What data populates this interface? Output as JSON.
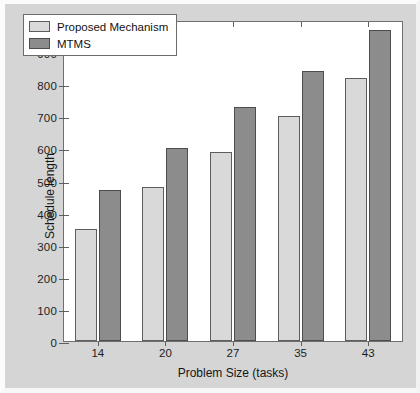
{
  "chart_data": {
    "type": "bar",
    "title": "",
    "xlabel": "Problem Size (tasks)",
    "ylabel": "Schedule length",
    "categories": [
      "14",
      "20",
      "27",
      "35",
      "43"
    ],
    "series": [
      {
        "name": "Proposed Mechanism",
        "color": "#d9d9d9",
        "values": [
          350,
          480,
          588,
          700,
          818
        ]
      },
      {
        "name": "MTMS",
        "color": "#8c8c8c",
        "values": [
          470,
          600,
          728,
          840,
          968
        ]
      }
    ],
    "ylim": [
      0,
      1000
    ],
    "ytick_labels": [
      "0",
      "100",
      "200",
      "300",
      "400",
      "500",
      "600",
      "700",
      "800",
      "900",
      "1000"
    ],
    "ytick_values": [
      0,
      100,
      200,
      300,
      400,
      500,
      600,
      700,
      800,
      900,
      1000
    ],
    "grid": false,
    "legend_position": "top-left",
    "figure_background": "#d5d5d5",
    "axes_background": "#ffffff"
  }
}
